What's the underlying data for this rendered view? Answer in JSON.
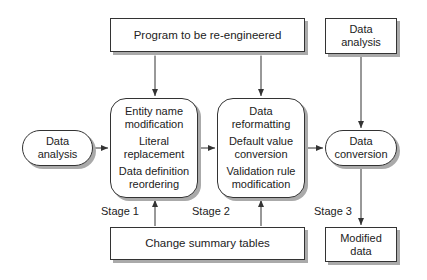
{
  "nodes": {
    "program": {
      "label": "Program to be re-engineered"
    },
    "data_analysis_top": {
      "lines": [
        "Data",
        "analysis"
      ]
    },
    "data_analysis_left": {
      "lines": [
        "Data",
        "analysis"
      ]
    },
    "stage1": {
      "groups": [
        [
          "Entity name",
          "modification"
        ],
        [
          "Literal",
          "replacement"
        ],
        [
          "Data definition",
          "reordering"
        ]
      ]
    },
    "stage2": {
      "groups": [
        [
          "Data",
          "reformatting"
        ],
        [
          "Default value",
          "conversion"
        ],
        [
          "Validation rule",
          "modification"
        ]
      ]
    },
    "data_conversion": {
      "lines": [
        "Data",
        "conversion"
      ]
    },
    "change_summary": {
      "label": "Change summary tables"
    },
    "modified_data": {
      "lines": [
        "Modified",
        "data"
      ]
    }
  },
  "stages": {
    "s1": "Stage 1",
    "s2": "Stage 2",
    "s3": "Stage 3"
  },
  "colors": {
    "stroke": "#333333",
    "shadow": "#aaaaaa",
    "fill": "#ffffff"
  }
}
